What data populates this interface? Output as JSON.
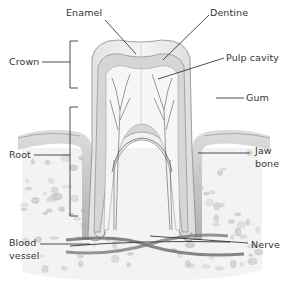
{
  "diagram": {
    "labels": {
      "enamel": "Enamel",
      "dentine": "Dentine",
      "crown": "Crown",
      "pulp_cavity": "Pulp cavity",
      "gum": "Gum",
      "root": "Root",
      "jaw_bone_line1": "Jaw",
      "jaw_bone_line2": "bone",
      "blood_vessel_line1": "Blood",
      "blood_vessel_line2": "vessel",
      "nerve": "Nerve"
    },
    "colors": {
      "label_text": "#333333",
      "leader_line": "#222222",
      "tooth_outline": "#8a8a8a",
      "bone_spots": "#c4c4c4"
    }
  }
}
